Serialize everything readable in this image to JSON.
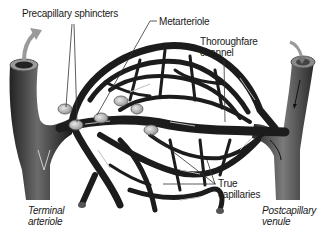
{
  "diagram": {
    "labels": {
      "precapillary_sphincters": "Precapillary sphincters",
      "metarteriole": "Metarteriole",
      "thoroughfare_channel": [
        "Thoroughfare",
        "channel"
      ],
      "true_capillaries": [
        "True",
        "capillaries"
      ],
      "terminal_arteriole": [
        "Terminal",
        "arteriole"
      ],
      "postcapillary_venule": [
        "Postcapillary",
        "venule"
      ]
    },
    "nodes": [
      {
        "id": "terminal-arteriole",
        "label": "Terminal arteriole",
        "side": "left"
      },
      {
        "id": "metarteriole",
        "label": "Metarteriole"
      },
      {
        "id": "precapillary-sphincters",
        "label": "Precapillary sphincters",
        "count": 6
      },
      {
        "id": "true-capillaries",
        "label": "True capillaries"
      },
      {
        "id": "thoroughfare-channel",
        "label": "Thoroughfare channel"
      },
      {
        "id": "postcapillary-venule",
        "label": "Postcapillary venule",
        "side": "right"
      }
    ],
    "edges": [
      {
        "from": "terminal-arteriole",
        "to": "metarteriole",
        "label": "blood flow"
      },
      {
        "from": "metarteriole",
        "to": "thoroughfare-channel"
      },
      {
        "from": "metarteriole",
        "to": "true-capillaries",
        "via": "precapillary-sphincters"
      },
      {
        "from": "true-capillaries",
        "to": "thoroughfare-channel"
      },
      {
        "from": "thoroughfare-channel",
        "to": "postcapillary-venule"
      }
    ],
    "colors": {
      "vessel": "#1c1c1c",
      "vessel_highlight": "#6a6a6a",
      "sphincter": "#b8b8b8",
      "flow_arrow": "#9a9a9a",
      "leader_line": "#333333",
      "background": "#ffffff"
    }
  }
}
